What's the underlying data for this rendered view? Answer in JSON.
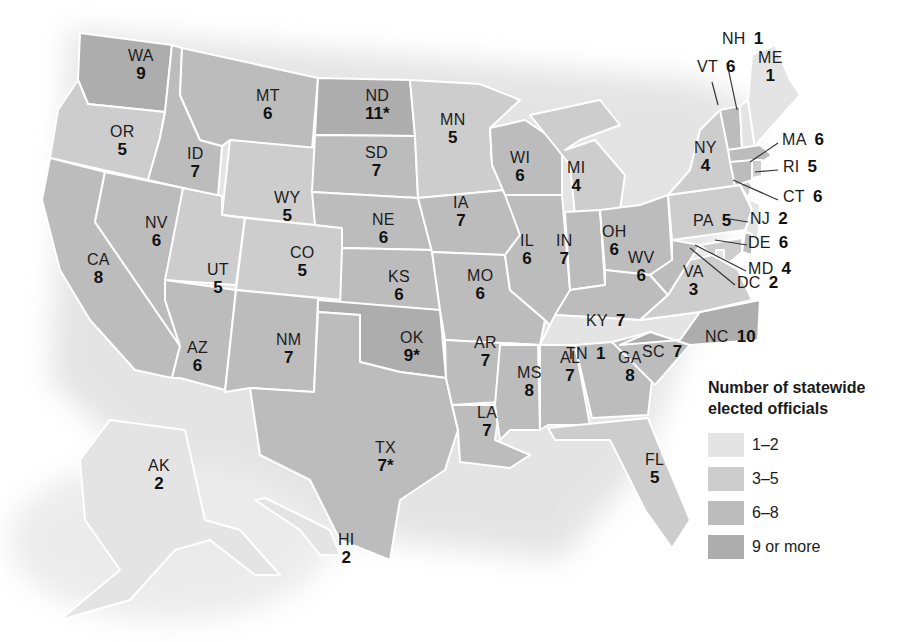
{
  "map": {
    "title": "Number of statewide elected officials",
    "title_lines": [
      "Number of statewide",
      "elected officials"
    ],
    "colors": {
      "1-2": "#e4e4e4",
      "3-5": "#cdcdcd",
      "6-8": "#bcbcbc",
      "9+": "#adadad",
      "border": "#ffffff",
      "background": "#ffffff"
    },
    "legend": [
      {
        "label": "1–2",
        "bucket": "1-2"
      },
      {
        "label": "3–5",
        "bucket": "3-5"
      },
      {
        "label": "6–8",
        "bucket": "6-8"
      },
      {
        "label": "9 or more",
        "bucket": "9+"
      }
    ],
    "states": [
      {
        "abbr": "WA",
        "value": "9",
        "bucket": "9+"
      },
      {
        "abbr": "OR",
        "value": "5",
        "bucket": "3-5"
      },
      {
        "abbr": "CA",
        "value": "8",
        "bucket": "6-8"
      },
      {
        "abbr": "ID",
        "value": "7",
        "bucket": "6-8"
      },
      {
        "abbr": "NV",
        "value": "6",
        "bucket": "6-8"
      },
      {
        "abbr": "MT",
        "value": "6",
        "bucket": "6-8"
      },
      {
        "abbr": "WY",
        "value": "5",
        "bucket": "3-5"
      },
      {
        "abbr": "UT",
        "value": "5",
        "bucket": "3-5"
      },
      {
        "abbr": "AZ",
        "value": "6",
        "bucket": "6-8"
      },
      {
        "abbr": "CO",
        "value": "5",
        "bucket": "3-5"
      },
      {
        "abbr": "NM",
        "value": "7",
        "bucket": "6-8"
      },
      {
        "abbr": "ND",
        "value": "11*",
        "bucket": "9+"
      },
      {
        "abbr": "SD",
        "value": "7",
        "bucket": "6-8"
      },
      {
        "abbr": "NE",
        "value": "6",
        "bucket": "6-8"
      },
      {
        "abbr": "KS",
        "value": "6",
        "bucket": "6-8"
      },
      {
        "abbr": "OK",
        "value": "9*",
        "bucket": "9+"
      },
      {
        "abbr": "TX",
        "value": "7*",
        "bucket": "6-8"
      },
      {
        "abbr": "MN",
        "value": "5",
        "bucket": "3-5"
      },
      {
        "abbr": "IA",
        "value": "7",
        "bucket": "6-8"
      },
      {
        "abbr": "MO",
        "value": "6",
        "bucket": "6-8"
      },
      {
        "abbr": "AR",
        "value": "7",
        "bucket": "6-8"
      },
      {
        "abbr": "LA",
        "value": "7",
        "bucket": "6-8"
      },
      {
        "abbr": "WI",
        "value": "6",
        "bucket": "6-8"
      },
      {
        "abbr": "IL",
        "value": "6",
        "bucket": "6-8"
      },
      {
        "abbr": "MI",
        "value": "4",
        "bucket": "3-5"
      },
      {
        "abbr": "IN",
        "value": "7",
        "bucket": "6-8"
      },
      {
        "abbr": "OH",
        "value": "6",
        "bucket": "6-8"
      },
      {
        "abbr": "KY",
        "value": "7",
        "bucket": "6-8"
      },
      {
        "abbr": "TN",
        "value": "1",
        "bucket": "1-2"
      },
      {
        "abbr": "MS",
        "value": "8",
        "bucket": "6-8"
      },
      {
        "abbr": "AL",
        "value": "7",
        "bucket": "6-8"
      },
      {
        "abbr": "GA",
        "value": "8",
        "bucket": "6-8"
      },
      {
        "abbr": "FL",
        "value": "5",
        "bucket": "3-5"
      },
      {
        "abbr": "SC",
        "value": "7",
        "bucket": "6-8"
      },
      {
        "abbr": "NC",
        "value": "10",
        "bucket": "9+"
      },
      {
        "abbr": "VA",
        "value": "3",
        "bucket": "3-5"
      },
      {
        "abbr": "WV",
        "value": "6",
        "bucket": "6-8"
      },
      {
        "abbr": "PA",
        "value": "5",
        "bucket": "3-5"
      },
      {
        "abbr": "NY",
        "value": "4",
        "bucket": "3-5"
      },
      {
        "abbr": "VT",
        "value": "6",
        "bucket": "6-8"
      },
      {
        "abbr": "NH",
        "value": "1",
        "bucket": "1-2"
      },
      {
        "abbr": "ME",
        "value": "1",
        "bucket": "1-2"
      },
      {
        "abbr": "MA",
        "value": "6",
        "bucket": "6-8"
      },
      {
        "abbr": "RI",
        "value": "5",
        "bucket": "3-5"
      },
      {
        "abbr": "CT",
        "value": "6",
        "bucket": "6-8"
      },
      {
        "abbr": "NJ",
        "value": "2",
        "bucket": "1-2"
      },
      {
        "abbr": "DE",
        "value": "6",
        "bucket": "6-8"
      },
      {
        "abbr": "MD",
        "value": "4",
        "bucket": "3-5"
      },
      {
        "abbr": "DC",
        "value": "2",
        "bucket": "1-2"
      },
      {
        "abbr": "AK",
        "value": "2",
        "bucket": "1-2"
      },
      {
        "abbr": "HI",
        "value": "2",
        "bucket": "1-2"
      }
    ],
    "callouts": [
      "NH",
      "VT",
      "MA",
      "RI",
      "CT",
      "NJ",
      "DE",
      "MD",
      "DC"
    ],
    "footnote_marker": "*"
  }
}
